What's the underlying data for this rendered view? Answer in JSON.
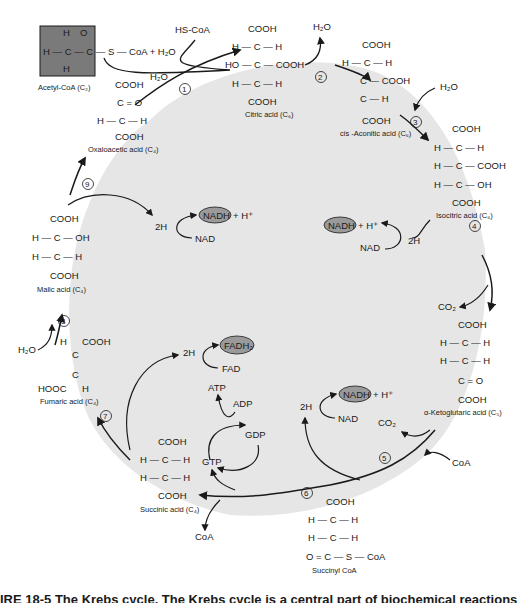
{
  "title": "The Krebs cycle",
  "colors": {
    "cycle_fill": "#e6e6e6",
    "acetyl_box": "#7a7a7a",
    "cofactor_oval": "#9a9a9a",
    "ink": "#1a1a1a"
  },
  "acetyl_coa": {
    "label": "Acetyl-CoA (C",
    "sub": "2",
    "plus": "+ H",
    "water_sub": "2",
    "water_o": "O",
    "coa": "S — CoA"
  },
  "step1": {
    "number": "1",
    "released": "HS-CoA",
    "water": "H₂O"
  },
  "step2": {
    "number": "2",
    "released": "H₂O"
  },
  "step3": {
    "number": "3",
    "added": "H₂O"
  },
  "step4": {
    "number": "4",
    "nadh": "NADH",
    "h_plus": "+ H⁺",
    "nad": "NAD",
    "two_h": "2H",
    "co2": "CO₂"
  },
  "step5": {
    "number": "5",
    "nadh": "NADH",
    "h_plus": "+ H⁺",
    "nad": "NAD",
    "two_h": "2H",
    "co2": "CO₂",
    "coa": "CoA"
  },
  "step6": {
    "number": "6",
    "atp": "ATP",
    "adp": "ADP",
    "gdp": "GDP",
    "gtp": "GTP",
    "coa": "CoA"
  },
  "step7": {
    "number": "7",
    "fadh2": "FADH₂",
    "fad": "FAD",
    "two_h": "2H"
  },
  "step8": {
    "number": "8",
    "water": "H₂O"
  },
  "step9": {
    "number": "9",
    "nadh": "NADH",
    "h_plus": "+ H⁺",
    "nad": "NAD",
    "two_h": "2H"
  },
  "compounds": [
    {
      "id": "citric",
      "name": "Citric acid (C₆)"
    },
    {
      "id": "cis-aconitic",
      "name": "cis -Aconitic acid (C₆)"
    },
    {
      "id": "isocitric",
      "name": "Isocitric acid (C₆)"
    },
    {
      "id": "alpha-ketoglutaric",
      "name": "α-Ketoglutaric acid (C₅)"
    },
    {
      "id": "succinyl-coa",
      "name": "Succinyl CoA"
    },
    {
      "id": "succinic",
      "name": "Succinic acid (C₄)"
    },
    {
      "id": "fumaric",
      "name": "Fumaric acid (C₄)"
    },
    {
      "id": "malic",
      "name": "Malic acid (C₄)"
    },
    {
      "id": "oxaloacetic",
      "name": "Oxaloacetic acid (C₄)"
    }
  ],
  "caption": "IRE 18-5   The Krebs cycle. The Krebs cycle is a central part of biochemical reactions"
}
